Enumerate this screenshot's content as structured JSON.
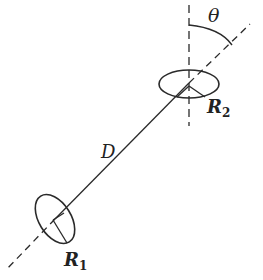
{
  "diagram": {
    "labels": {
      "theta": "θ",
      "distance": "D",
      "r2_main": "R",
      "r2_sub": "2",
      "r1_main": "R",
      "r1_sub": "1"
    },
    "colors": {
      "stroke": "#2a2a2a",
      "background": "#ffffff"
    }
  }
}
